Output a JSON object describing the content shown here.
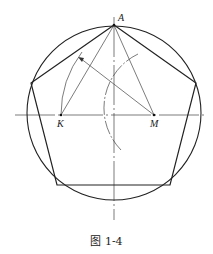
{
  "figure": {
    "caption": "图 1-4",
    "labels": {
      "A": "A",
      "K": "K",
      "M": "M"
    },
    "colors": {
      "stroke": "#222222",
      "thin_stroke": "#444444",
      "background": "#ffffff"
    },
    "geometry": {
      "circle": {
        "cx": 114,
        "cy": 113,
        "r": 87
      },
      "points": {
        "A": [
          114,
          25
        ],
        "K": [
          61,
          115
        ],
        "M": [
          154,
          115
        ],
        "P_left_upper": [
          31,
          83
        ],
        "P_right_upper": [
          196,
          83
        ],
        "P_bottom_left": [
          57,
          185
        ],
        "P_bottom_right": [
          170,
          185
        ]
      }
    }
  }
}
